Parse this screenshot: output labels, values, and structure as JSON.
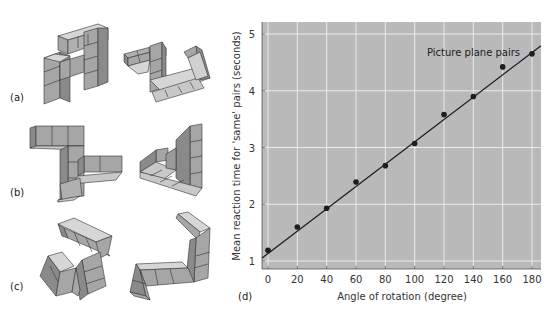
{
  "figure": {
    "panels": [
      {
        "label": "(a)",
        "description": "pair of cube-block figures rotated in picture plane"
      },
      {
        "label": "(b)",
        "description": "pair of cube-block figures rotated in depth"
      },
      {
        "label": "(c)",
        "description": "pair of different cube-block figures"
      },
      {
        "label": "(d)",
        "description": "reaction time vs angle of rotation"
      }
    ],
    "colors": {
      "plot_background": "#b9b9b9",
      "grid": "#ebebeb",
      "line": "#1e1e1e",
      "points": "#1e1e1e",
      "cube_top": "#d8d8d8",
      "cube_front": "#a8a8a8",
      "cube_side": "#8e8e8e"
    }
  },
  "chart_data": {
    "type": "scatter",
    "title": "",
    "annotation": "Picture plane pairs",
    "xlabel": "Angle of rotation (degree)",
    "ylabel": "Mean reaction time for 'same' pairs (seconds)",
    "xlim": [
      -4,
      186
    ],
    "ylim": [
      0.95,
      5.2
    ],
    "xticks": [
      "0",
      "20",
      "40",
      "60",
      "80",
      "100",
      "120",
      "140",
      "160",
      "180"
    ],
    "yticks": [
      "1",
      "2",
      "3",
      "4",
      "5"
    ],
    "grid": true,
    "series": [
      {
        "name": "Picture plane pairs",
        "x": [
          0,
          20,
          40,
          60,
          80,
          100,
          120,
          140,
          160,
          180
        ],
        "values": [
          1.19,
          1.6,
          1.93,
          2.39,
          2.68,
          3.07,
          3.58,
          3.9,
          4.42,
          4.65
        ]
      }
    ],
    "fit_line": {
      "intercept": 1.13,
      "slope": 0.0197
    }
  }
}
